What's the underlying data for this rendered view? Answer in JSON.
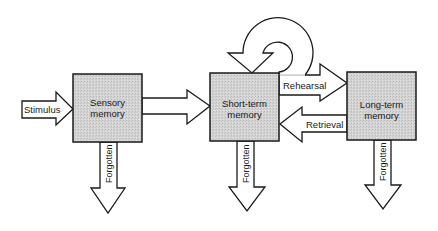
{
  "diagram": {
    "type": "flow",
    "title": "",
    "colors": {
      "box_fill": "#cfcfcf",
      "stroke": "#1a1a1a",
      "arrow_fill": "#ffffff",
      "background": "#ffffff"
    },
    "nodes": [
      {
        "id": "sensory",
        "line1": "Sensory",
        "line2": "memory"
      },
      {
        "id": "short_term",
        "line1": "Short-term",
        "line2": "memory"
      },
      {
        "id": "long_term",
        "line1": "Long-term",
        "line2": "memory"
      }
    ],
    "arrows": {
      "stimulus": {
        "label": "Stimulus",
        "from": "",
        "to": "sensory"
      },
      "sensory_to_stm": {
        "label": "",
        "from": "sensory",
        "to": "short_term"
      },
      "loop": {
        "label": "",
        "from": "short_term",
        "to": "short_term"
      },
      "rehearsal": {
        "label": "Rehearsal",
        "from": "short_term",
        "to": "long_term"
      },
      "retrieval": {
        "label": "Retrieval",
        "from": "long_term",
        "to": "short_term"
      },
      "forgotten_sensory": {
        "label": "Forgotten",
        "from": "sensory",
        "to": ""
      },
      "forgotten_stm": {
        "label": "Forgotten",
        "from": "short_term",
        "to": ""
      },
      "forgotten_ltm": {
        "label": "Forgotten",
        "from": "long_term",
        "to": ""
      }
    }
  }
}
